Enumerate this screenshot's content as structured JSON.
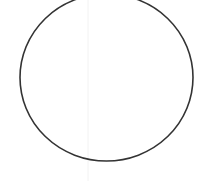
{
  "shape": {
    "type": "ellipse",
    "cx": 106.5,
    "cy": 77.5,
    "rx": 86.5,
    "ry": 83.5,
    "stroke": "#333333",
    "stroke_width": 1.6,
    "fill": "none"
  },
  "guide_line": {
    "x": 88,
    "color": "#f2f2f2"
  },
  "background": "#ffffff"
}
